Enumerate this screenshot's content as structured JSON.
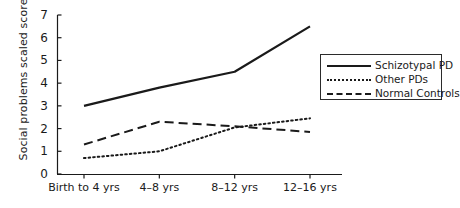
{
  "chart_data": {
    "type": "line",
    "title": "",
    "xlabel": "",
    "ylabel": "Social problems scaled scores",
    "categories": [
      "Birth to 4 yrs",
      "4–8 yrs",
      "8–12 yrs",
      "12–16 yrs"
    ],
    "ylim": [
      0,
      7
    ],
    "yticks": [
      0,
      1,
      2,
      3,
      4,
      5,
      6,
      7
    ],
    "grid": false,
    "legend_position": "right",
    "series": [
      {
        "name": "Schizotypal PD",
        "style": "solid",
        "color": "#1a1a1a",
        "values": [
          3.0,
          3.8,
          4.5,
          6.5
        ]
      },
      {
        "name": "Other PDs",
        "style": "dotted",
        "color": "#1a1a1a",
        "values": [
          0.7,
          1.0,
          2.05,
          2.45
        ]
      },
      {
        "name": "Normal Controls",
        "style": "dashed",
        "color": "#1a1a1a",
        "values": [
          1.3,
          2.3,
          2.1,
          1.85
        ]
      }
    ]
  },
  "axis": {
    "y_tick_labels": [
      "7",
      "6",
      "5",
      "4",
      "3",
      "2",
      "1",
      "0"
    ],
    "y_axis_title": "Social problems scaled scores"
  },
  "legend": {
    "items": [
      {
        "label": "Schizotypal PD",
        "style": "solid"
      },
      {
        "label": "Other PDs",
        "style": "dotted"
      },
      {
        "label": "Normal Controls",
        "style": "dashed"
      }
    ]
  }
}
